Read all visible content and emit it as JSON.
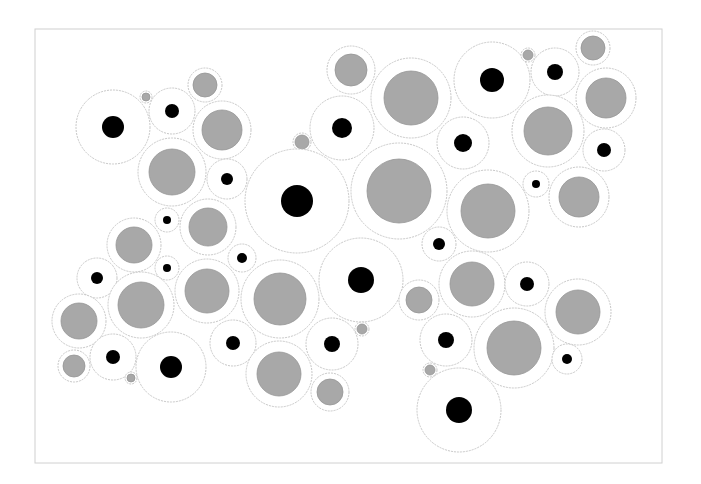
{
  "diagram": {
    "title": "",
    "frame": {
      "x": 35,
      "y": 29,
      "width": 627,
      "height": 434,
      "stroke": "#d0d0d0"
    },
    "colors": {
      "outer_fill": "#ffffff",
      "outer_stroke": "#c8c8c8",
      "core_black": "#000000",
      "core_gray": "#a8a8a8",
      "core_gray_stroke": "#959595"
    },
    "circles": [
      {
        "cx": 113,
        "cy": 127,
        "r": 37,
        "core": "black",
        "cr": 11
      },
      {
        "cx": 146,
        "cy": 97,
        "r": 6,
        "core": "gray",
        "cr": 4
      },
      {
        "cx": 172,
        "cy": 111,
        "r": 23,
        "core": "black",
        "cr": 7
      },
      {
        "cx": 205,
        "cy": 85,
        "r": 17,
        "core": "gray",
        "cr": 12
      },
      {
        "cx": 222,
        "cy": 130,
        "r": 29,
        "core": "gray",
        "cr": 20
      },
      {
        "cx": 172,
        "cy": 172,
        "r": 34,
        "core": "gray",
        "cr": 23
      },
      {
        "cx": 227,
        "cy": 179,
        "r": 20,
        "core": "black",
        "cr": 6
      },
      {
        "cx": 351,
        "cy": 70,
        "r": 24,
        "core": "gray",
        "cr": 16
      },
      {
        "cx": 411,
        "cy": 98,
        "r": 40,
        "core": "gray",
        "cr": 27
      },
      {
        "cx": 342,
        "cy": 128,
        "r": 32,
        "core": "black",
        "cr": 10
      },
      {
        "cx": 302,
        "cy": 142,
        "r": 9,
        "core": "gray",
        "cr": 7
      },
      {
        "cx": 492,
        "cy": 80,
        "r": 38,
        "core": "black",
        "cr": 12
      },
      {
        "cx": 528,
        "cy": 55,
        "r": 7,
        "core": "gray",
        "cr": 5
      },
      {
        "cx": 555,
        "cy": 72,
        "r": 24,
        "core": "black",
        "cr": 8
      },
      {
        "cx": 593,
        "cy": 48,
        "r": 17,
        "core": "gray",
        "cr": 12
      },
      {
        "cx": 606,
        "cy": 98,
        "r": 30,
        "core": "gray",
        "cr": 20
      },
      {
        "cx": 548,
        "cy": 131,
        "r": 36,
        "core": "gray",
        "cr": 24
      },
      {
        "cx": 463,
        "cy": 143,
        "r": 26,
        "core": "black",
        "cr": 9
      },
      {
        "cx": 604,
        "cy": 150,
        "r": 21,
        "core": "black",
        "cr": 7
      },
      {
        "cx": 297,
        "cy": 201,
        "r": 52,
        "core": "black",
        "cr": 16
      },
      {
        "cx": 399,
        "cy": 191,
        "r": 48,
        "core": "gray",
        "cr": 32
      },
      {
        "cx": 488,
        "cy": 211,
        "r": 41,
        "core": "gray",
        "cr": 27
      },
      {
        "cx": 536,
        "cy": 184,
        "r": 13,
        "core": "black",
        "cr": 4
      },
      {
        "cx": 579,
        "cy": 197,
        "r": 30,
        "core": "gray",
        "cr": 20
      },
      {
        "cx": 439,
        "cy": 244,
        "r": 17,
        "core": "black",
        "cr": 6
      },
      {
        "cx": 242,
        "cy": 258,
        "r": 14,
        "core": "black",
        "cr": 5
      },
      {
        "cx": 167,
        "cy": 220,
        "r": 12,
        "core": "black",
        "cr": 4
      },
      {
        "cx": 208,
        "cy": 227,
        "r": 28,
        "core": "gray",
        "cr": 19
      },
      {
        "cx": 134,
        "cy": 245,
        "r": 27,
        "core": "gray",
        "cr": 18
      },
      {
        "cx": 167,
        "cy": 268,
        "r": 12,
        "core": "black",
        "cr": 4
      },
      {
        "cx": 97,
        "cy": 278,
        "r": 20,
        "core": "black",
        "cr": 6
      },
      {
        "cx": 141,
        "cy": 305,
        "r": 33,
        "core": "gray",
        "cr": 23
      },
      {
        "cx": 207,
        "cy": 291,
        "r": 32,
        "core": "gray",
        "cr": 22
      },
      {
        "cx": 79,
        "cy": 321,
        "r": 27,
        "core": "gray",
        "cr": 18
      },
      {
        "cx": 74,
        "cy": 366,
        "r": 16,
        "core": "gray",
        "cr": 11
      },
      {
        "cx": 113,
        "cy": 357,
        "r": 23,
        "core": "black",
        "cr": 7
      },
      {
        "cx": 131,
        "cy": 378,
        "r": 6,
        "core": "gray",
        "cr": 4
      },
      {
        "cx": 171,
        "cy": 367,
        "r": 35,
        "core": "black",
        "cr": 11
      },
      {
        "cx": 233,
        "cy": 343,
        "r": 23,
        "core": "black",
        "cr": 7
      },
      {
        "cx": 280,
        "cy": 299,
        "r": 39,
        "core": "gray",
        "cr": 26
      },
      {
        "cx": 361,
        "cy": 280,
        "r": 42,
        "core": "black",
        "cr": 13
      },
      {
        "cx": 419,
        "cy": 300,
        "r": 20,
        "core": "gray",
        "cr": 13
      },
      {
        "cx": 362,
        "cy": 329,
        "r": 7,
        "core": "gray",
        "cr": 5
      },
      {
        "cx": 332,
        "cy": 344,
        "r": 26,
        "core": "black",
        "cr": 8
      },
      {
        "cx": 279,
        "cy": 374,
        "r": 33,
        "core": "gray",
        "cr": 22
      },
      {
        "cx": 330,
        "cy": 392,
        "r": 19,
        "core": "gray",
        "cr": 13
      },
      {
        "cx": 472,
        "cy": 284,
        "r": 33,
        "core": "gray",
        "cr": 22
      },
      {
        "cx": 527,
        "cy": 284,
        "r": 22,
        "core": "black",
        "cr": 7
      },
      {
        "cx": 578,
        "cy": 312,
        "r": 33,
        "core": "gray",
        "cr": 22
      },
      {
        "cx": 446,
        "cy": 340,
        "r": 26,
        "core": "black",
        "cr": 8
      },
      {
        "cx": 514,
        "cy": 348,
        "r": 40,
        "core": "gray",
        "cr": 27
      },
      {
        "cx": 567,
        "cy": 359,
        "r": 15,
        "core": "black",
        "cr": 5
      },
      {
        "cx": 430,
        "cy": 370,
        "r": 7,
        "core": "gray",
        "cr": 5
      },
      {
        "cx": 459,
        "cy": 410,
        "r": 42,
        "core": "black",
        "cr": 13
      }
    ]
  }
}
